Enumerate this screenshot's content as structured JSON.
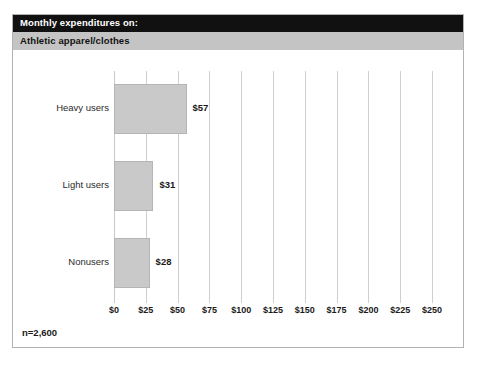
{
  "header": {
    "title": "Monthly expenditures on:",
    "subtitle": "Athletic apparel/clothes",
    "title_bg": "#111111",
    "title_fg": "#ffffff",
    "subtitle_bg": "#c4c4c4",
    "subtitle_fg": "#121212"
  },
  "footnote": "n=2,600",
  "chart_data": {
    "type": "bar",
    "orientation": "horizontal",
    "title": "Monthly expenditures on:",
    "subtitle": "Athletic apparel/clothes",
    "xlabel": "",
    "ylabel": "",
    "categories": [
      "Heavy users",
      "Light users",
      "Nonusers"
    ],
    "values": [
      57,
      31,
      28
    ],
    "value_labels": [
      "$57",
      "$31",
      "$28"
    ],
    "xlim": [
      0,
      250
    ],
    "xticks": [
      0,
      25,
      50,
      75,
      100,
      125,
      150,
      175,
      200,
      225,
      250
    ],
    "xtick_labels": [
      "$0",
      "$25",
      "$50",
      "$75",
      "$100",
      "$125",
      "$150",
      "$175",
      "$200",
      "$225",
      "$250"
    ],
    "grid": "vertical",
    "legend": "none",
    "bar_color": "#c9c9c9",
    "bar_border_color": "#b5b5b5",
    "gridline_color": "#cfcfcf",
    "note": "n=2,600",
    "bars": [
      {
        "category": "Heavy users",
        "value": 57,
        "label": "$57"
      },
      {
        "category": "Light users",
        "value": 31,
        "label": "$31"
      },
      {
        "category": "Nonusers",
        "value": 28,
        "label": "$28"
      }
    ]
  }
}
